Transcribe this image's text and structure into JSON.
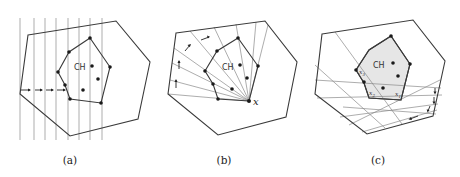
{
  "figure": {
    "panels": [
      {
        "id": "a",
        "caption": "(a)",
        "hull_label": "CH",
        "description": "vertical sweep lines with rightward arrows"
      },
      {
        "id": "b",
        "caption": "(b)",
        "hull_label": "CH",
        "apex_label": "x",
        "description": "rays from point x with arrows"
      },
      {
        "id": "c",
        "caption": "(c)",
        "hull_label": "CH",
        "point_labels": [
          "x1",
          "x2",
          "x3"
        ],
        "description": "shaded hull with tangent lines and arrows"
      }
    ]
  },
  "colors": {
    "stroke": "#3a3a3a",
    "ray": "#8a8a8a",
    "hull_fill": "#e6e6e6",
    "points": "#1a1a1a"
  }
}
